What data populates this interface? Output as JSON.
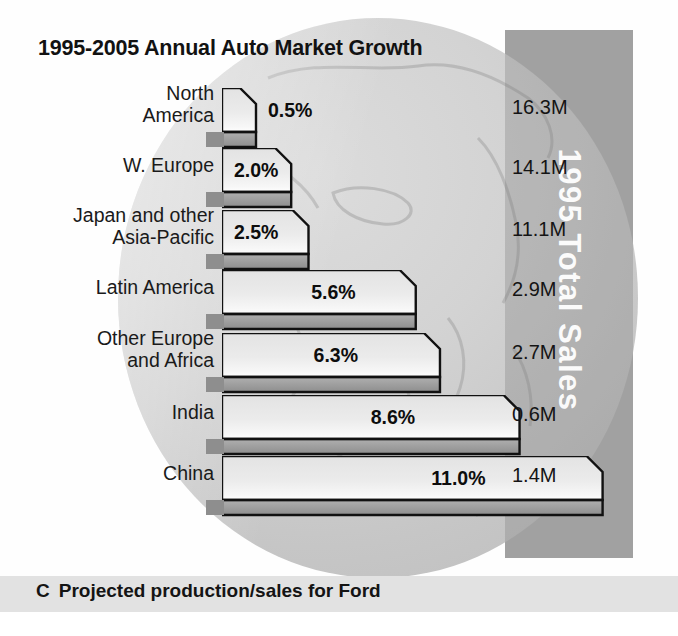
{
  "title": "1995-2005 Annual Auto Market Growth",
  "vertical_label": "1995 Total Sales",
  "caption": {
    "letter": "C",
    "text": "Projected production/sales for Ford"
  },
  "axis": {
    "title": "%",
    "ticks": [
      "0",
      "1",
      "2",
      "3",
      "4",
      "5",
      "6",
      "7",
      "8",
      "9",
      "10",
      "11"
    ]
  },
  "rows": [
    {
      "label_line1": "North",
      "label_line2": "America",
      "value": "0.5%",
      "sales": "16.3M"
    },
    {
      "label_line1": "W. Europe",
      "label_line2": "",
      "value": "2.0%",
      "sales": "14.1M"
    },
    {
      "label_line1": "Japan and other",
      "label_line2": "Asia-Pacific",
      "value": "2.5%",
      "sales": "11.1M"
    },
    {
      "label_line1": "Latin America",
      "label_line2": "",
      "value": "5.6%",
      "sales": "2.9M"
    },
    {
      "label_line1": "Other Europe",
      "label_line2": "and Africa",
      "value": "6.3%",
      "sales": "2.7M"
    },
    {
      "label_line1": "India",
      "label_line2": "",
      "value": "8.6%",
      "sales": "0.6M"
    },
    {
      "label_line1": "China",
      "label_line2": "",
      "value": "11.0%",
      "sales": "1.4M"
    }
  ],
  "colors": {
    "bar_top_face": "#e8e8e8",
    "bar_front_face": "#9a9a9a",
    "bar_outline": "#111111",
    "highlight": "#ffffff",
    "band": "#b4b4b4",
    "globe": "#cfcfcf",
    "caption_band": "#e2e2e2",
    "text": "#141414"
  },
  "chart_data": {
    "type": "bar",
    "title": "1995-2005 Annual Auto Market Growth",
    "xlabel": "%",
    "ylabel": "",
    "orientation": "horizontal",
    "categories": [
      "North America",
      "W. Europe",
      "Japan and other Asia-Pacific",
      "Latin America",
      "Other Europe and Africa",
      "India",
      "China"
    ],
    "values": [
      0.5,
      2.0,
      2.5,
      5.6,
      6.3,
      8.6,
      11.0
    ],
    "value_labels": [
      "0.5%",
      "2.0%",
      "2.5%",
      "5.6%",
      "6.3%",
      "8.6%",
      "11.0%"
    ],
    "secondary_series": {
      "name": "1995 Total Sales",
      "values": [
        16.3,
        14.1,
        11.1,
        2.9,
        2.7,
        0.6,
        1.4
      ],
      "labels": [
        "16.3M",
        "14.1M",
        "11.1M",
        "2.9M",
        "2.7M",
        "0.6M",
        "1.4M"
      ],
      "unit": "M"
    },
    "xlim": [
      0,
      11
    ],
    "xticks": [
      0,
      1,
      2,
      3,
      4,
      5,
      6,
      7,
      8,
      9,
      10,
      11
    ],
    "grid": false,
    "legend": "none",
    "annotation": "C  Projected production/sales for Ford"
  }
}
